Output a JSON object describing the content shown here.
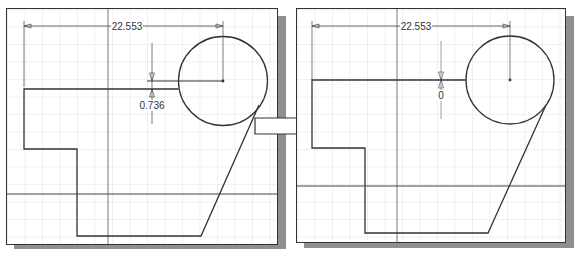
{
  "figure": {
    "arrow": {
      "direction": "right"
    },
    "panels": [
      {
        "id": "before",
        "horizontal_dimension": "22.553",
        "vertical_dimension": "0.736"
      },
      {
        "id": "after",
        "horizontal_dimension": "22.553",
        "vertical_dimension": "0"
      }
    ],
    "colors": {
      "line": "#333333",
      "grid": "#d9d9d9",
      "shadow": "#8f8f8f",
      "background": "#ffffff"
    }
  }
}
